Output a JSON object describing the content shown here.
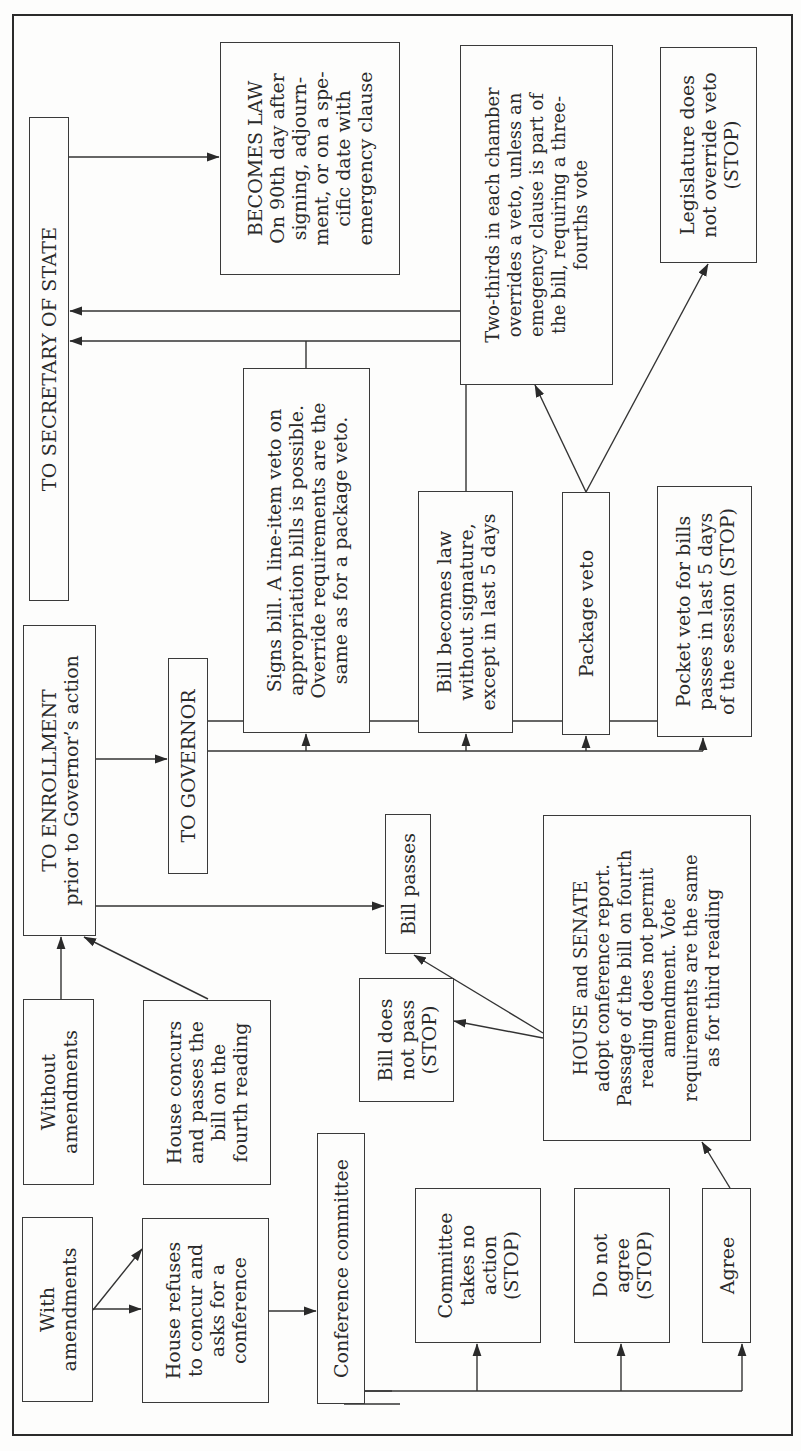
{
  "diagram": {
    "title_orientation": "rotated 90 degrees counter-clockwise",
    "nodes": {
      "secretary_of_state": "TO SECRETARY OF STATE",
      "becomes_law": "BECOMES LAW\nOn 90th day after\nsigning, adjourn-\nment, or on a spe-\ncific date with\nemergency clause",
      "two_thirds_override": "Two-thirds in each chamber\noverrides a veto, unless an\nemegency clause is part of\nthe bill, requiring a three-\nfourths vote",
      "legislature_no_override": "Legislature does\nnot override veto\n(STOP)",
      "signs_bill": "Signs bill. A line-item veto on\nappropriation bills is possible.\nOverride requirements are the\nsame as for a package veto.",
      "law_without_signature": "Bill becomes law\nwithout signature,\nexcept in last 5 days",
      "package_veto": "Package veto",
      "pocket_veto": "Pocket veto for bills\npasses in last 5 days\nof the session (STOP)",
      "to_enrollment": "TO ENROLLMENT\nprior to Governor’s action",
      "to_governor": "TO GOVERNOR",
      "bill_passes": "Bill passes",
      "bill_does_not_pass": "Bill does\nnot pass\n(STOP)",
      "house_senate_adopt": "HOUSE and SENATE\nadopt conference report.\nPassage of the bill on fourth\nreading does not permit\namendment. Vote\nrequirements are the same\nas for third reading",
      "without_amendments": "Without\namendments",
      "house_concurs": "House concurs\nand passes the\nbill on the\nfourth reading",
      "with_amendments": "With\namendments",
      "house_refuses": "House refuses\nto concur and\nasks for a\nconference",
      "conference_committee": "Conference committee",
      "committee_no_action": "Committee\ntakes no\naction\n(STOP)",
      "do_not_agree": "Do not\nagree\n(STOP)",
      "agree": "Agree"
    },
    "edges": [
      {
        "from": "with_amendments",
        "to": "house_refuses"
      },
      {
        "from": "with_amendments",
        "to": "house_concurs"
      },
      {
        "from": "without_amendments",
        "to": "to_enrollment"
      },
      {
        "from": "house_concurs",
        "to": "to_enrollment"
      },
      {
        "from": "house_refuses",
        "to": "conference_committee"
      },
      {
        "from": "conference_committee",
        "to": "committee_no_action"
      },
      {
        "from": "conference_committee",
        "to": "do_not_agree"
      },
      {
        "from": "conference_committee",
        "to": "agree"
      },
      {
        "from": "agree",
        "to": "house_senate_adopt"
      },
      {
        "from": "house_senate_adopt",
        "to": "bill_passes"
      },
      {
        "from": "house_senate_adopt",
        "to": "bill_does_not_pass"
      },
      {
        "from": "to_enrollment",
        "to": "to_governor"
      },
      {
        "from": "to_enrollment",
        "to": "bill_passes"
      },
      {
        "from": "to_governor",
        "to": "signs_bill"
      },
      {
        "from": "to_governor",
        "to": "law_without_signature"
      },
      {
        "from": "to_governor",
        "to": "package_veto"
      },
      {
        "from": "to_governor",
        "to": "pocket_veto"
      },
      {
        "from": "signs_bill",
        "to": "secretary_of_state"
      },
      {
        "from": "law_without_signature",
        "to": "secretary_of_state"
      },
      {
        "from": "package_veto",
        "to": "two_thirds_override"
      },
      {
        "from": "package_veto",
        "to": "legislature_no_override"
      },
      {
        "from": "two_thirds_override",
        "to": "secretary_of_state"
      },
      {
        "from": "secretary_of_state",
        "to": "becomes_law"
      }
    ]
  }
}
